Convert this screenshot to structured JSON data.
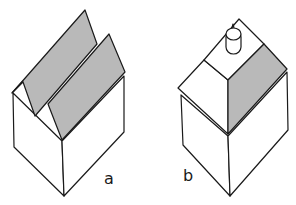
{
  "figure": {
    "panels": [
      {
        "id": "a",
        "label": "a",
        "description": "house with two offset pitched roof planes"
      },
      {
        "id": "b",
        "label": "b",
        "description": "house with gabled roof and chimney"
      }
    ],
    "colors": {
      "line": "#1a1a1a",
      "roof_shade": "#b9b9b9",
      "background": "#ffffff"
    }
  }
}
